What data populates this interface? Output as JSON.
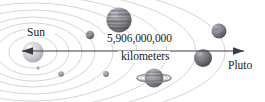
{
  "diagram": {
    "background_color": "#ffffff",
    "labels": {
      "sun": "Sun",
      "pluto": "Pluto",
      "distance_value": "5,906,000,000",
      "distance_unit": "kilometers"
    },
    "measurement": {
      "value_numeric": 5906000000,
      "unit": "kilometers",
      "from": "Sun",
      "to": "Pluto",
      "arrow_style": "double-headed"
    },
    "colors": {
      "arrow": "#3b3b47",
      "orbit": "#b9b9bf",
      "text": "#1a1a1a",
      "sun": "#c9c9cc",
      "jupiter": "#8c8c90",
      "saturn": "#9a9a9e",
      "uranus": "#7e7e86",
      "neptune": "#6f6f78",
      "small_planet": "#9e9ea4"
    },
    "bodies": [
      {
        "name": "sun",
        "label": "Sun",
        "cx": 33,
        "cy": 52,
        "r": 10.5
      },
      {
        "name": "mercury",
        "label": "",
        "cx": 38,
        "cy": 68,
        "r": 1.4
      },
      {
        "name": "venus",
        "label": "",
        "cx": 61,
        "cy": 74,
        "r": 2.8
      },
      {
        "name": "earth",
        "label": "",
        "cx": 106,
        "cy": 74,
        "r": 2.9
      },
      {
        "name": "mars",
        "label": "",
        "cx": 90,
        "cy": 35,
        "r": 4.2
      },
      {
        "name": "jupiter",
        "label": "",
        "cx": 119,
        "cy": 20,
        "r": 12.5
      },
      {
        "name": "saturn",
        "label": "",
        "cx": 154,
        "cy": 78,
        "r": 9.5
      },
      {
        "name": "uranus",
        "label": "",
        "cx": 219,
        "cy": 31,
        "r": 7.5
      },
      {
        "name": "neptune",
        "label": "",
        "cx": 203,
        "cy": 58,
        "r": 9.0
      }
    ],
    "orbits": [
      {
        "name": "orbit-1",
        "rx": 24,
        "ry": 16
      },
      {
        "name": "orbit-2",
        "rx": 36,
        "ry": 23
      },
      {
        "name": "orbit-3",
        "rx": 49,
        "ry": 29
      },
      {
        "name": "orbit-4",
        "rx": 62,
        "ry": 35
      },
      {
        "name": "orbit-5",
        "rx": 80,
        "ry": 42
      },
      {
        "name": "orbit-6",
        "rx": 104,
        "ry": 49
      },
      {
        "name": "orbit-7",
        "rx": 134,
        "ry": 56
      },
      {
        "name": "orbit-8",
        "rx": 163,
        "ry": 62
      },
      {
        "name": "orbit-9",
        "rx": 192,
        "ry": 68
      }
    ],
    "arrow": {
      "x1": 22,
      "x2": 244,
      "y": 51
    }
  }
}
